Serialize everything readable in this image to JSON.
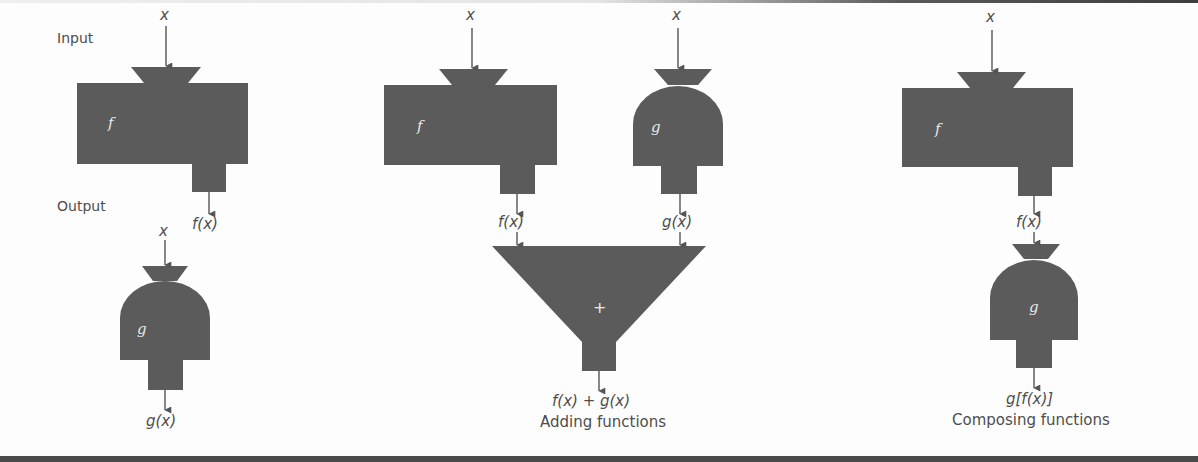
{
  "labels": {
    "input": "Input",
    "output": "Output"
  },
  "panel_basic": {
    "f": {
      "input": "x",
      "name": "f",
      "output": "f(x)"
    },
    "g": {
      "input": "x",
      "name": "g",
      "output": "g(x)"
    }
  },
  "panel_adding": {
    "f": {
      "input": "x",
      "name": "f",
      "output": "f(x)"
    },
    "g": {
      "input": "x",
      "name": "g",
      "output": "g(x)"
    },
    "adder": {
      "name": "+",
      "output": "f(x) + g(x)"
    },
    "caption": "Adding functions"
  },
  "panel_composing": {
    "f": {
      "input": "x",
      "name": "f",
      "output": "f(x)"
    },
    "g": {
      "name": "g",
      "output": "g[f(x)]"
    },
    "caption": "Composing functions"
  },
  "colors": {
    "machine_fill": "#5b5b5b",
    "arrow": "#555555",
    "text": "#4d4d4d",
    "background": "#fdfdfd"
  }
}
